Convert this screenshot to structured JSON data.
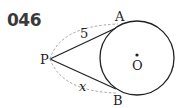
{
  "problem": {
    "number": "046"
  },
  "diagram": {
    "labels": {
      "P": "P",
      "A": "A",
      "B": "B",
      "O": "O",
      "PA_length": "5",
      "PB_length": "x"
    },
    "colors": {
      "line": "#222222",
      "dashed": "#9a9a9a"
    }
  }
}
